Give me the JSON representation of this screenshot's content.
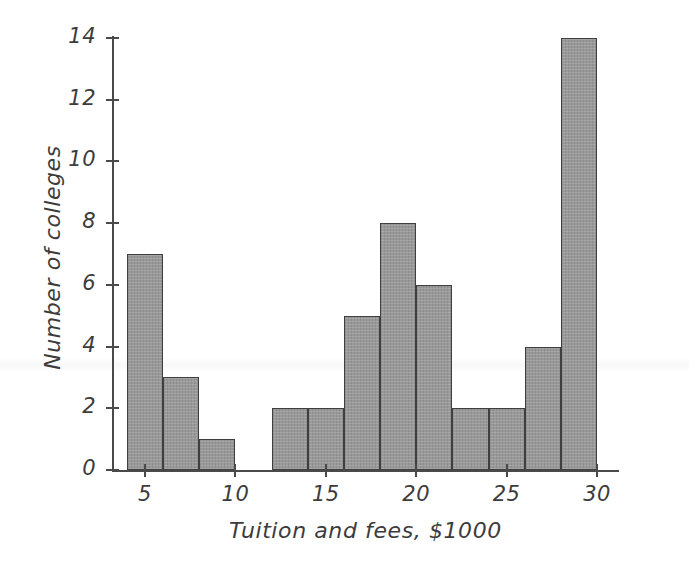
{
  "chart_data": {
    "type": "bar",
    "title": "",
    "subtitle": "",
    "xlabel": "Tuition and fees, $1000",
    "ylabel": "Number of colleges",
    "grid": false,
    "legend": null,
    "xlim": [
      3,
      31
    ],
    "ylim": [
      0,
      14
    ],
    "bin_width": 2,
    "x_tick_labels": [
      "5",
      "10",
      "15",
      "20",
      "25",
      "30"
    ],
    "x_tick_values": [
      5,
      10,
      15,
      20,
      25,
      30
    ],
    "y_tick_labels": [
      "0",
      "2",
      "4",
      "6",
      "8",
      "10",
      "12",
      "14"
    ],
    "y_tick_values": [
      0,
      2,
      4,
      6,
      8,
      10,
      12,
      14
    ],
    "bin_edges": [
      4,
      6,
      8,
      10,
      12,
      14,
      16,
      18,
      20,
      22,
      24,
      26,
      28,
      30
    ],
    "categories": [
      "4-6",
      "6-8",
      "8-10",
      "10-12",
      "12-14",
      "14-16",
      "16-18",
      "18-20",
      "20-22",
      "22-24",
      "24-26",
      "26-28",
      "28-30"
    ],
    "values": [
      7,
      3,
      1,
      0,
      2,
      2,
      5,
      8,
      6,
      2,
      2,
      4,
      14
    ],
    "bar_fill_color": "#949494",
    "bar_edge_color": "#3f3f3f",
    "axis_color": "#4a4a4a",
    "text_color": "#3c3c3c",
    "background_color": "#ffffff"
  }
}
